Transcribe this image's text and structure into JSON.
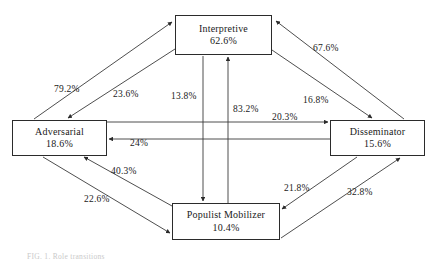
{
  "figure": {
    "caption": "FIG. 1. Role transitions",
    "type": "transition-diagram"
  },
  "nodes": [
    {
      "id": "interpretive",
      "label": "Interpretive",
      "value": "62.6%",
      "x": 175,
      "y": 15,
      "w": 97,
      "h": 40
    },
    {
      "id": "adversarial",
      "label": "Adversarial",
      "value": "18.6%",
      "x": 12,
      "y": 120,
      "w": 95,
      "h": 36
    },
    {
      "id": "disseminator",
      "label": "Disseminator",
      "value": "15.6%",
      "x": 330,
      "y": 120,
      "w": 95,
      "h": 36
    },
    {
      "id": "populist",
      "label": "Populist Mobilizer",
      "value": "10.4%",
      "x": 172,
      "y": 203,
      "w": 108,
      "h": 37
    }
  ],
  "edges": [
    {
      "id": "adversarial-to-interpretive",
      "from": "adversarial",
      "to": "interpretive",
      "value": "79.2%",
      "lx": 54,
      "ly": 84
    },
    {
      "id": "interpretive-to-adversarial",
      "from": "interpretive",
      "to": "adversarial",
      "value": "23.6%",
      "lx": 113,
      "ly": 89
    },
    {
      "id": "interpretive-to-populist",
      "from": "interpretive",
      "to": "populist",
      "value": "13.8%",
      "lx": 171,
      "ly": 91
    },
    {
      "id": "populist-to-interpretive",
      "from": "populist",
      "to": "interpretive",
      "value": "83.2%",
      "lx": 233,
      "ly": 104
    },
    {
      "id": "disseminator-to-interpretive",
      "from": "disseminator",
      "to": "interpretive",
      "value": "67.6%",
      "lx": 313,
      "ly": 43
    },
    {
      "id": "interpretive-to-disseminator",
      "from": "interpretive",
      "to": "disseminator",
      "value": "16.8%",
      "lx": 303,
      "ly": 95
    },
    {
      "id": "adversarial-to-disseminator",
      "from": "adversarial",
      "to": "disseminator",
      "value": "20.3%",
      "lx": 272,
      "ly": 112
    },
    {
      "id": "disseminator-to-adversarial",
      "from": "disseminator",
      "to": "adversarial",
      "value": "24%",
      "lx": 130,
      "ly": 138
    },
    {
      "id": "populist-to-adversarial",
      "from": "populist",
      "to": "adversarial",
      "value": "40.3%",
      "lx": 111,
      "ly": 166
    },
    {
      "id": "adversarial-to-populist",
      "from": "adversarial",
      "to": "populist",
      "value": "22.6%",
      "lx": 84,
      "ly": 194
    },
    {
      "id": "disseminator-to-populist",
      "from": "disseminator",
      "to": "populist",
      "value": "21.8%",
      "lx": 284,
      "ly": 183
    },
    {
      "id": "populist-to-disseminator",
      "from": "populist",
      "to": "disseminator",
      "value": "32.8%",
      "lx": 347,
      "ly": 187
    }
  ],
  "style": {
    "line_color": "#3a3a3a",
    "box_border_color": "#2b2b2b",
    "text_color": "#1a1a1a",
    "background": "#ffffff"
  }
}
